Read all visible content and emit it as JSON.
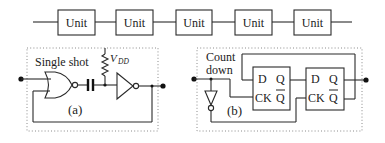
{
  "chain": {
    "units": [
      {
        "label": "Unit"
      },
      {
        "label": "Unit"
      },
      {
        "label": "Unit"
      },
      {
        "label": "Unit"
      },
      {
        "label": "Unit"
      }
    ]
  },
  "panel_a": {
    "title": "Single shot",
    "supply_label": "V",
    "supply_subscript": "DD",
    "caption": "(a)",
    "components": [
      "NOR gate",
      "capacitor",
      "pull-up resistor",
      "inverter"
    ]
  },
  "panel_b": {
    "title_line1": "Count",
    "title_line2": "down",
    "caption": "(b)",
    "flipflops": [
      {
        "d": "D",
        "ck": "CK",
        "q": "Q",
        "qbar": "Q"
      },
      {
        "d": "D",
        "ck": "CK",
        "q": "Q",
        "qbar": "Q"
      }
    ],
    "components": [
      "inverter",
      "D flip-flop",
      "D flip-flop"
    ]
  }
}
